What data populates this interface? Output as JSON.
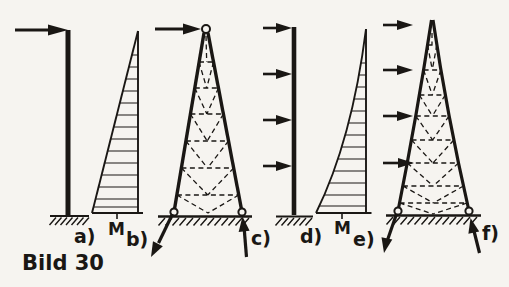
{
  "caption": "Bild 30",
  "colors": {
    "ink": "#1a1714",
    "paper": "#f6f4f0"
  },
  "panels": {
    "a": {
      "label": "a)"
    },
    "b": {
      "label": "b)",
      "moment_label": "M"
    },
    "c": {
      "label": "c)"
    },
    "d": {
      "label": "d)"
    },
    "e": {
      "label": "e)",
      "moment_label": "M"
    },
    "f": {
      "label": "f)"
    }
  }
}
